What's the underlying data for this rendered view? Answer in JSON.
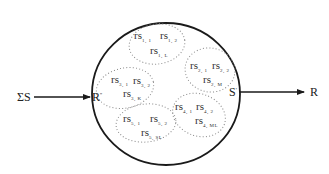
{
  "diagram": {
    "input_label": "ΣS",
    "output_label": "R",
    "entry_node": {
      "label": "R",
      "mark": "''"
    },
    "exit_node": {
      "label": "S",
      "mark": "'"
    },
    "colors": {
      "stroke": "#1a1a1a",
      "dotted": "#888888",
      "text": "#222222"
    },
    "clusters": [
      {
        "name": "cluster-1",
        "items": [
          {
            "base": "rs",
            "sub": "1, 1"
          },
          {
            "base": "rs",
            "sub": "1, 2"
          },
          {
            "base": "rs",
            "sub": "1, L"
          }
        ]
      },
      {
        "name": "cluster-2",
        "items": [
          {
            "base": "rs",
            "sub": "2, 1"
          },
          {
            "base": "rs",
            "sub": "2, 2"
          },
          {
            "base": "rs",
            "sub": "2, M"
          }
        ]
      },
      {
        "name": "cluster-3",
        "items": [
          {
            "base": "rs",
            "sub": "3, 1"
          },
          {
            "base": "rs",
            "sub": "3, 2"
          },
          {
            "base": "rs",
            "sub": "3, K"
          }
        ]
      },
      {
        "name": "cluster-4",
        "items": [
          {
            "base": "rs",
            "sub": "4, 1"
          },
          {
            "base": "rs",
            "sub": "4, 2"
          },
          {
            "base": "rs",
            "sub": "4, ML"
          }
        ]
      },
      {
        "name": "cluster-5",
        "items": [
          {
            "base": "rs",
            "sub": "5, 1"
          },
          {
            "base": "rs",
            "sub": "5, 2"
          },
          {
            "base": "rs",
            "sub": "5, SL"
          }
        ]
      }
    ]
  }
}
